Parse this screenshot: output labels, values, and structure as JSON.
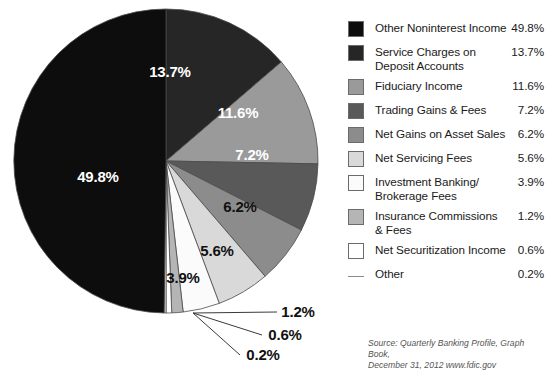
{
  "chart_data": {
    "type": "pie",
    "title": "",
    "categories": [
      "Other Noninterest Income",
      "Service Charges on Deposit Accounts",
      "Fiduciary Income",
      "Trading Gains & Fees",
      "Net Gains on Asset Sales",
      "Net Servicing Fees",
      "Investment Banking/ Brokerage Fees",
      "Insurance Commissions & Fees",
      "Net Securitization Income",
      "Other"
    ],
    "values": [
      49.8,
      13.7,
      11.6,
      7.2,
      6.2,
      5.6,
      3.9,
      1.2,
      0.6,
      0.2
    ],
    "value_labels": [
      "49.8%",
      "13.7%",
      "11.6%",
      "7.2%",
      "6.2%",
      "5.6%",
      "3.9%",
      "1.2%",
      "0.6%",
      "0.2%"
    ],
    "colors": [
      "#0d0d0d",
      "#262626",
      "#9a9a9a",
      "#595959",
      "#8c8c8c",
      "#d9d9d9",
      "#fbfbfb",
      "#b5b5b5",
      "#ffffff",
      "#f2f2f2"
    ],
    "legend_position": "right",
    "grid": false,
    "unit": "percent"
  },
  "slice_labels": [
    {
      "text": "49.8%",
      "x": 98,
      "y": 182,
      "tone": "on-dark"
    },
    {
      "text": "13.7%",
      "x": 170,
      "y": 77,
      "tone": "on-dark"
    },
    {
      "text": "11.6%",
      "x": 238,
      "y": 118,
      "tone": "on-dark"
    },
    {
      "text": "7.2%",
      "x": 252,
      "y": 160,
      "tone": "on-dark"
    },
    {
      "text": "6.2%",
      "x": 240,
      "y": 212,
      "tone": "on-light"
    },
    {
      "text": "5.6%",
      "x": 217,
      "y": 256,
      "tone": "on-light"
    },
    {
      "text": "3.9%",
      "x": 183,
      "y": 283,
      "tone": "on-light"
    }
  ],
  "callouts": [
    {
      "text": "1.2%",
      "x": 298,
      "y": 317
    },
    {
      "text": "0.6%",
      "x": 285,
      "y": 340
    },
    {
      "text": "0.2%",
      "x": 263,
      "y": 360
    }
  ],
  "legend": {
    "items": [
      {
        "label_line1": "Other Noninterest Income",
        "label_line2": "",
        "value": "49.8%",
        "marker": "box",
        "color": "#0d0d0d",
        "name": "other-noninterest-income"
      },
      {
        "label_line1": "Service Charges on",
        "label_line2": "Deposit Accounts",
        "value": "13.7%",
        "marker": "box",
        "color": "#262626",
        "name": "service-charges-on-deposit-accounts"
      },
      {
        "label_line1": "Fiduciary Income",
        "label_line2": "",
        "value": "11.6%",
        "marker": "box",
        "color": "#9a9a9a",
        "name": "fiduciary-income"
      },
      {
        "label_line1": "Trading Gains & Fees",
        "label_line2": "",
        "value": "7.2%",
        "marker": "box",
        "color": "#595959",
        "name": "trading-gains-and-fees"
      },
      {
        "label_line1": "Net Gains on Asset Sales",
        "label_line2": "",
        "value": "6.2%",
        "marker": "box",
        "color": "#8c8c8c",
        "name": "net-gains-on-asset-sales"
      },
      {
        "label_line1": "Net Servicing Fees",
        "label_line2": "",
        "value": "5.6%",
        "marker": "box",
        "color": "#d9d9d9",
        "name": "net-servicing-fees"
      },
      {
        "label_line1": "Investment Banking/",
        "label_line2": "Brokerage Fees",
        "value": "3.9%",
        "marker": "box",
        "color": "#fbfbfb",
        "name": "investment-banking-brokerage-fees"
      },
      {
        "label_line1": "Insurance Commissions",
        "label_line2": "& Fees",
        "value": "1.2%",
        "marker": "box",
        "color": "#b5b5b5",
        "name": "insurance-commissions-and-fees"
      },
      {
        "label_line1": "Net Securitization Income",
        "label_line2": "",
        "value": "0.6%",
        "marker": "box",
        "color": "#ffffff",
        "name": "net-securitization-income"
      },
      {
        "label_line1": "Other",
        "label_line2": "",
        "value": "0.2%",
        "marker": "line",
        "color": "#8a8a8a",
        "name": "other"
      }
    ]
  },
  "source": {
    "line1": "Source: Quarterly Banking Profile, Graph Book,",
    "line2": "December 31, 2012  www.fdic.gov"
  }
}
